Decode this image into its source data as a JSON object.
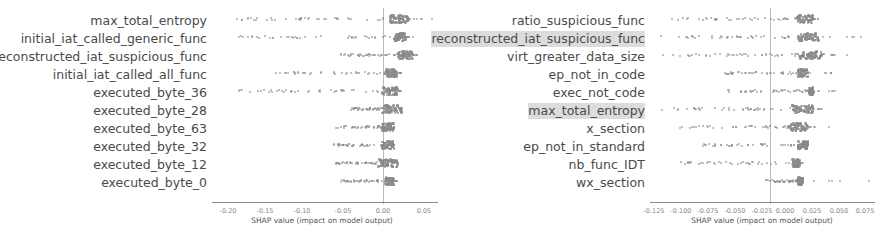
{
  "chart_data": [
    {
      "type": "scatter",
      "title": "",
      "xlabel": "SHAP value (impact on model output)",
      "ylabel": "",
      "xlim": [
        -0.22,
        0.065
      ],
      "xticks": [
        "-0.20",
        "-0.15",
        "-0.10",
        "-0.05",
        "0.00",
        "0.05"
      ],
      "grid": false,
      "legend": null,
      "features": [
        {
          "name": "max_total_entropy",
          "highlight": false,
          "min": -0.2,
          "max": 0.06,
          "dense": [
            0.005,
            0.03
          ]
        },
        {
          "name": "initial_iat_called_generic_func",
          "highlight": false,
          "min": -0.19,
          "max": 0.035,
          "dense": [
            0.01,
            0.025
          ]
        },
        {
          "name": "reconstructed_iat_suspicious_func",
          "highlight": false,
          "min": -0.06,
          "max": 0.04,
          "dense": [
            0.015,
            0.035
          ]
        },
        {
          "name": "initial_iat_called_all_func",
          "highlight": false,
          "min": -0.14,
          "max": 0.02,
          "dense": [
            0.0,
            0.015
          ]
        },
        {
          "name": "executed_byte_36",
          "highlight": false,
          "min": -0.19,
          "max": 0.02,
          "dense": [
            -0.005,
            0.015
          ]
        },
        {
          "name": "executed_byte_28",
          "highlight": false,
          "min": -0.045,
          "max": 0.02,
          "dense": [
            -0.005,
            0.02
          ]
        },
        {
          "name": "executed_byte_63",
          "highlight": false,
          "min": -0.065,
          "max": 0.01,
          "dense": [
            -0.005,
            0.01
          ]
        },
        {
          "name": "executed_byte_32",
          "highlight": false,
          "min": -0.07,
          "max": 0.01,
          "dense": [
            -0.005,
            0.01
          ]
        },
        {
          "name": "executed_byte_12",
          "highlight": false,
          "min": -0.065,
          "max": 0.015,
          "dense": [
            -0.01,
            0.015
          ]
        },
        {
          "name": "executed_byte_0",
          "highlight": false,
          "min": -0.06,
          "max": 0.015,
          "dense": [
            -0.002,
            0.01
          ]
        }
      ]
    },
    {
      "type": "scatter",
      "title": "",
      "xlabel": "SHAP value (impact on model output)",
      "ylabel": "",
      "xlim": [
        -0.13,
        0.085
      ],
      "xticks": [
        "-0.125",
        "-0.100",
        "-0.075",
        "-0.050",
        "-0.025",
        "0.000",
        "0.025",
        "0.050",
        "0.075"
      ],
      "grid": false,
      "legend": null,
      "features": [
        {
          "name": "ratio_suspicious_func",
          "highlight": false,
          "min": -0.11,
          "max": 0.03,
          "dense": [
            0.01,
            0.025
          ]
        },
        {
          "name": "reconstructed_iat_suspicious_func",
          "highlight": true,
          "min": -0.12,
          "max": 0.07,
          "dense": [
            0.01,
            0.03
          ]
        },
        {
          "name": "virt_greater_data_size",
          "highlight": false,
          "min": -0.125,
          "max": 0.06,
          "dense": [
            0.01,
            0.035
          ]
        },
        {
          "name": "ep_not_in_code",
          "highlight": false,
          "min": -0.06,
          "max": 0.05,
          "dense": [
            0.01,
            0.02
          ]
        },
        {
          "name": "exec_not_code",
          "highlight": false,
          "min": -0.06,
          "max": 0.05,
          "dense": [
            0.02,
            0.025
          ]
        },
        {
          "name": "max_total_entropy",
          "highlight": true,
          "min": -0.12,
          "max": 0.035,
          "dense": [
            0.005,
            0.025
          ]
        },
        {
          "name": "x_section",
          "highlight": false,
          "min": -0.11,
          "max": 0.04,
          "dense": [
            0.002,
            0.02
          ]
        },
        {
          "name": "ep_not_in_standard",
          "highlight": false,
          "min": -0.08,
          "max": 0.02,
          "dense": [
            0.01,
            0.02
          ]
        },
        {
          "name": "nb_func_IDT",
          "highlight": false,
          "min": -0.1,
          "max": 0.015,
          "dense": [
            0.005,
            0.012
          ]
        },
        {
          "name": "wx_section",
          "highlight": false,
          "min": -0.02,
          "max": 0.08,
          "dense": [
            0.01,
            0.015
          ]
        }
      ]
    }
  ],
  "left": {
    "xlabel": "SHAP value (impact on model output)",
    "ticks": [
      "-0.20",
      "-0.15",
      "-0.10",
      "-0.05",
      "0.00",
      "0.05"
    ],
    "labels": [
      "max_total_entropy",
      "initial_iat_called_generic_func",
      "reconstructed_iat_suspicious_func",
      "initial_iat_called_all_func",
      "executed_byte_36",
      "executed_byte_28",
      "executed_byte_63",
      "executed_byte_32",
      "executed_byte_12",
      "executed_byte_0"
    ]
  },
  "right": {
    "xlabel": "SHAP value (impact on model output)",
    "ticks": [
      "-0.125",
      "-0.100",
      "-0.075",
      "-0.050",
      "-0.025",
      "0.000",
      "0.025",
      "0.050",
      "0.075"
    ],
    "labels": [
      "ratio_suspicious_func",
      "reconstructed_iat_suspicious_func",
      "virt_greater_data_size",
      "ep_not_in_code",
      "exec_not_code",
      "max_total_entropy",
      "x_section",
      "ep_not_in_standard",
      "nb_func_IDT",
      "wx_section"
    ]
  }
}
